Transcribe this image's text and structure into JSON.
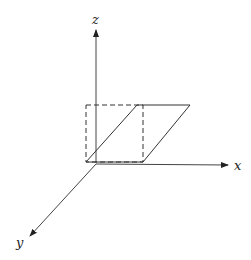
{
  "diagram": {
    "type": "3d-coordinate-axes-with-shear",
    "axes": {
      "x": {
        "label": "x"
      },
      "y": {
        "label": "y"
      },
      "z": {
        "label": "z"
      }
    },
    "shapes": [
      {
        "name": "unit-square",
        "style": "dashed",
        "description": "square in xz-plane"
      },
      {
        "name": "sheared-parallelogram",
        "style": "solid",
        "description": "square sheared along x"
      }
    ],
    "colors": {
      "stroke": "#333333",
      "background": "#ffffff"
    }
  }
}
